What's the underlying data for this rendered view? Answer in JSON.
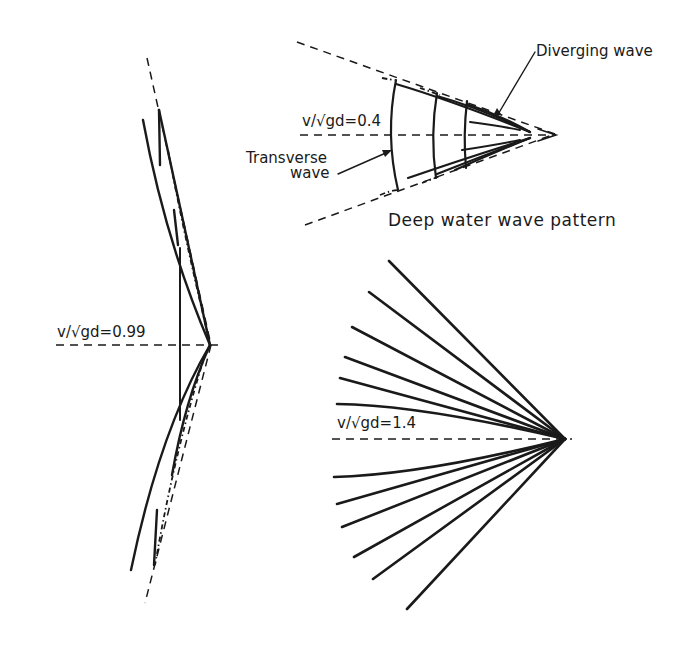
{
  "figure": {
    "panels": [
      {
        "id": "deep-water",
        "froude_label": {
          "lhs": "v/√gd",
          "eq": "=",
          "value": "0.4"
        },
        "annotations": {
          "diverging": "Diverging wave",
          "transverse_line1": "Transverse",
          "transverse_line2": "wave"
        },
        "caption": "Deep water wave pattern"
      },
      {
        "id": "critical",
        "froude_label": {
          "lhs": "v/√gd",
          "eq": "=",
          "value": "0.99"
        }
      },
      {
        "id": "supercritical",
        "froude_label": {
          "lhs": "v/√gd",
          "eq": "=",
          "value": "1.4"
        }
      }
    ],
    "colors": {
      "ink": "#1a1a1a",
      "background": "#ffffff"
    }
  }
}
